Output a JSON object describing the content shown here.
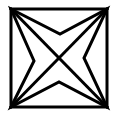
{
  "figure": {
    "stroke_color": "#000000",
    "background_color": "#ffffff",
    "stroke_width": 3,
    "square": {
      "x1": 11,
      "y1": 9,
      "x2": 107,
      "y2": 107
    },
    "diagonals": [
      {
        "from": [
          11,
          9
        ],
        "to": [
          107,
          107
        ]
      },
      {
        "from": [
          107,
          9
        ],
        "to": [
          11,
          107
        ]
      }
    ],
    "star_points": [
      [
        11,
        9
      ],
      [
        60,
        34
      ],
      [
        107,
        9
      ],
      [
        84,
        58
      ],
      [
        107,
        107
      ],
      [
        59,
        82
      ],
      [
        11,
        107
      ],
      [
        34,
        61
      ]
    ]
  }
}
